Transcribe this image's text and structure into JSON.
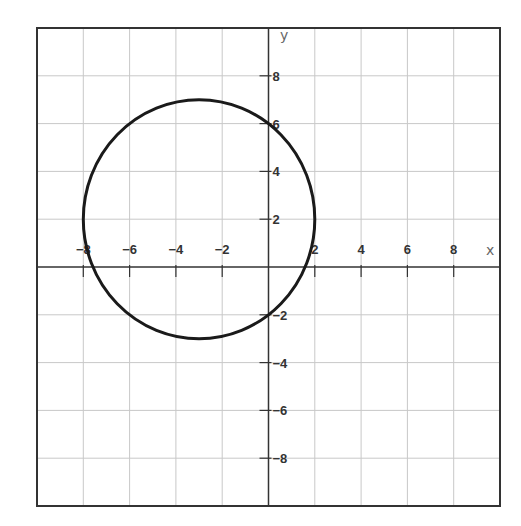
{
  "chart_data": {
    "type": "line",
    "title": "",
    "xlabel": "x",
    "ylabel": "y",
    "xlim": [
      -10,
      10
    ],
    "ylim": [
      -10,
      10
    ],
    "grid": true,
    "grid_step": 2,
    "x_ticks": [
      -8,
      -6,
      -4,
      -2,
      2,
      4,
      6,
      8
    ],
    "y_ticks": [
      8,
      6,
      4,
      2,
      -2,
      -4,
      -6,
      -8
    ],
    "x_tick_labels": [
      "−8",
      "−6",
      "−4",
      "−2",
      "2",
      "4",
      "6",
      "8"
    ],
    "y_tick_labels": [
      "8",
      "6",
      "4",
      "2",
      "−2",
      "−4",
      "−6",
      "−8"
    ],
    "series": [
      {
        "name": "circle",
        "shape": "circle",
        "equation": "(x+3)^2 + (y-2)^2 = 25",
        "center": [
          -3,
          2
        ],
        "radius": 5,
        "key_points": [
          [
            -3,
            7
          ],
          [
            -3,
            -3
          ],
          [
            -8,
            2
          ],
          [
            2,
            2
          ],
          [
            0,
            6
          ],
          [
            0,
            -2
          ]
        ],
        "color": "#1a1a1a"
      }
    ],
    "legend": null
  },
  "colors": {
    "grid": "#c8c8c8",
    "axis": "#333333",
    "frame": "#333333",
    "curve": "#1a1a1a",
    "background": "#ffffff"
  },
  "axes": {
    "x_name": "x",
    "y_name": "y"
  }
}
